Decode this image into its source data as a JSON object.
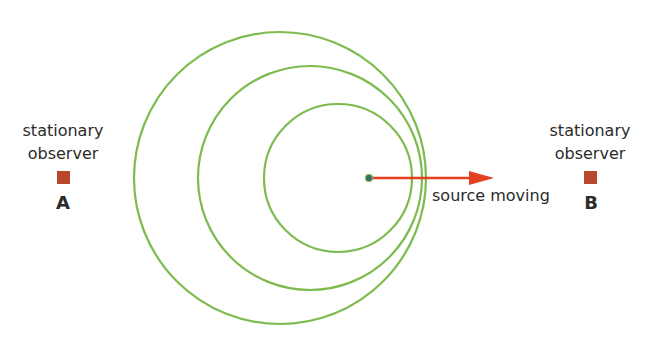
{
  "observers": [
    {
      "id": "A",
      "line1": "stationary",
      "line2": "observer",
      "letter": "A"
    },
    {
      "id": "B",
      "line1": "stationary",
      "line2": "observer",
      "letter": "B"
    }
  ],
  "source": {
    "label": "source moving",
    "direction": "right"
  },
  "wavefronts": [
    {
      "cx": 280,
      "cy": 178,
      "r": 146
    },
    {
      "cx": 310,
      "cy": 178,
      "r": 112
    },
    {
      "cx": 338,
      "cy": 178,
      "r": 74
    }
  ],
  "colors": {
    "wavefront": "#7dbb4e",
    "arrow": "#e2401f",
    "observer": "#b8472c",
    "source_dot": "#3a6b6b",
    "text": "#2b2b2b"
  }
}
